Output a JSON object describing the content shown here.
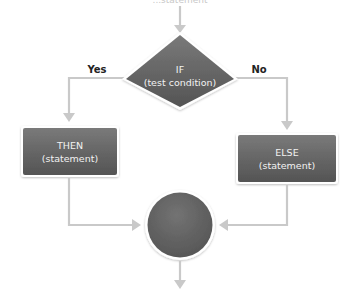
{
  "diagram": {
    "top_label": "...statement",
    "decision": {
      "line1": "IF",
      "line2": "(test condition)",
      "shape": "diamond",
      "color": "#5f5f5f"
    },
    "branches": {
      "yes_label": "Yes",
      "no_label": "No"
    },
    "then_box": {
      "line1": "THEN",
      "line2": "(statement)",
      "color": "#6a6a6a"
    },
    "else_box": {
      "line1": "ELSE",
      "line2": "(statement)",
      "color": "#6a6a6a"
    },
    "merge": {
      "shape": "circle",
      "color": "#616161"
    },
    "colors": {
      "connector": "#c9c9c9",
      "node_fill": "#666666",
      "node_text": "#f2f2f2",
      "label_text": "#222222",
      "background": "#ffffff"
    }
  }
}
